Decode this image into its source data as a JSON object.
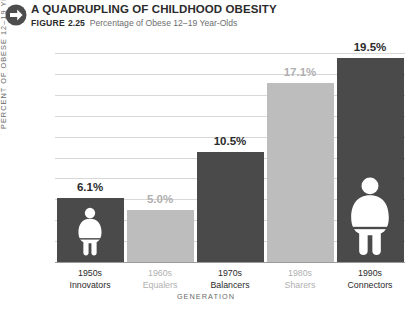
{
  "header": {
    "icon": "arrow-right-circle-icon",
    "title": "A QUADRUPLING OF CHILDHOOD OBESITY",
    "figure_word": "FIGURE",
    "figure_number": "2.25",
    "figure_caption": "Percentage of Obese 12–19 Year-Olds"
  },
  "colors": {
    "bar_dark": "#4a4a4a",
    "bar_light": "#bdbdbd",
    "label_dark": "#2b2b2b",
    "label_light": "#b0b0b0",
    "gridline": "#d8d8d8",
    "baseline": "#9a9a9a",
    "axis_text": "#6a6a6a",
    "figure_fill": "#ffffff",
    "background": "#ffffff"
  },
  "chart_data": {
    "type": "bar",
    "title": "A QUADRUPLING OF CHILDHOOD OBESITY",
    "subtitle": "Percentage of Obese 12–19 Year-Olds",
    "xlabel": "GENERATION",
    "ylabel": "PERCENT OF OBESE 12–19 YEAR-OLDS",
    "ylim": [
      0,
      20
    ],
    "grid": true,
    "legend": "none",
    "categories": [
      "1950s Innovators",
      "1960s Equalers",
      "1970s Balancers",
      "1980s Sharers",
      "1990s Connectors"
    ],
    "values": [
      6.1,
      5.0,
      10.5,
      17.1,
      19.5
    ],
    "value_labels": [
      "6.1%",
      "5.0%",
      "10.5%",
      "17.1%",
      "19.5%"
    ],
    "ytick_values": [
      0,
      2,
      4,
      6,
      8,
      10,
      12,
      14,
      16,
      18,
      20
    ],
    "ytick_labels": [
      "0.0%",
      "2.0%",
      "4.0%",
      "6.0%",
      "8.0%",
      "10.0%",
      "12.0%",
      "14.0%",
      "16.0%",
      "18.0%",
      "20.0%"
    ],
    "bars": [
      {
        "decade": "1950s",
        "generation": "Innovators",
        "value": 6.1,
        "value_label": "6.1%",
        "shade": "dark",
        "figure_icon": "obese-person-icon",
        "figure_size": "small"
      },
      {
        "decade": "1960s",
        "generation": "Equalers",
        "value": 5.0,
        "value_label": "5.0%",
        "shade": "light",
        "figure_icon": null,
        "figure_size": null
      },
      {
        "decade": "1970s",
        "generation": "Balancers",
        "value": 10.5,
        "value_label": "10.5%",
        "shade": "dark",
        "figure_icon": null,
        "figure_size": null
      },
      {
        "decade": "1980s",
        "generation": "Sharers",
        "value": 17.1,
        "value_label": "17.1%",
        "shade": "light",
        "figure_icon": null,
        "figure_size": null
      },
      {
        "decade": "1990s",
        "generation": "Connectors",
        "value": 19.5,
        "value_label": "19.5%",
        "shade": "dark",
        "figure_icon": "obese-person-icon",
        "figure_size": "large"
      }
    ]
  }
}
